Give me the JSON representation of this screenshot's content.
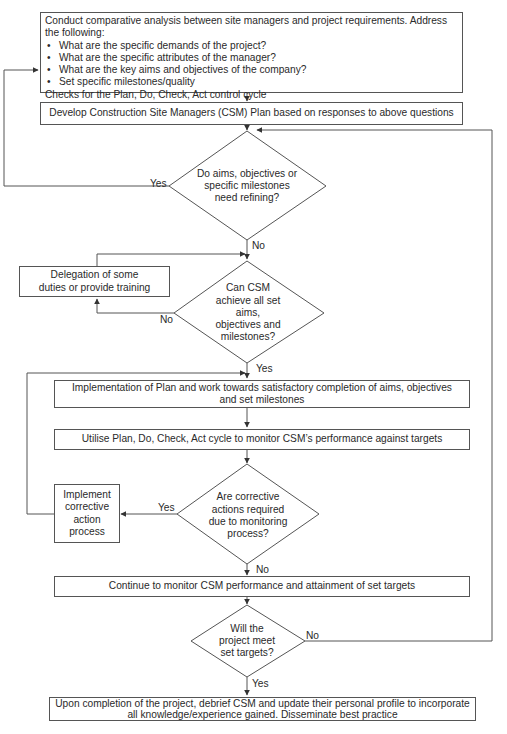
{
  "flowchart": {
    "start_box": {
      "intro": "Conduct comparative analysis between site managers and project requirements. Address the following:",
      "bullets": [
        "What are the specific demands of the project?",
        "What are the specific attributes of the manager?",
        "What are the key aims and objectives of the company?",
        "Set specific milestones/quality"
      ],
      "footer": "Checks for the Plan, Do, Check, Act control cycle"
    },
    "develop_box": "Develop Construction Site Managers (CSM) Plan based on responses to above questions",
    "decision_refine": "Do aims, objectives or specific milestones need refining?",
    "decision_refine_yes": "Yes",
    "decision_refine_no": "No",
    "delegation_box": "Delegation of some duties or provide training",
    "decision_achieve": "Can CSM achieve all set aims, objectives and milestones?",
    "decision_achieve_no": "No",
    "decision_achieve_yes": "Yes",
    "implementation_box": "Implementation of Plan and work towards satisfactory completion of aims, objectives and set milestones",
    "utilise_box": "Utilise Plan, Do, Check, Act cycle to monitor CSM’s performance against targets",
    "decision_corrective": "Are corrective actions required due to monitoring process?",
    "decision_corrective_yes": "Yes",
    "decision_corrective_no": "No",
    "corrective_box": "Implement corrective action process",
    "continue_box": "Continue to monitor CSM performance and attainment of set targets",
    "decision_targets": "Will the project meet set targets?",
    "decision_targets_no": "No",
    "decision_targets_yes": "Yes",
    "final_box": "Upon completion of the project, debrief CSM and update their personal profile to incorporate all knowledge/experience gained. Disseminate best practice"
  },
  "colors": {
    "line": "#555555",
    "text": "#2a2a2a",
    "background": "#ffffff"
  }
}
